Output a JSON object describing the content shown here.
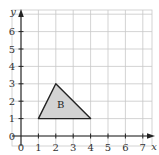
{
  "chart_data": {
    "type": "scatter",
    "title": "",
    "xlabel": "x",
    "ylabel": "y",
    "xlim": [
      0,
      7
    ],
    "ylim": [
      0,
      6
    ],
    "grid": true,
    "x_ticks": [
      "0",
      "1",
      "2",
      "3",
      "4",
      "5",
      "6",
      "7"
    ],
    "y_ticks": [
      "0",
      "1",
      "2",
      "3",
      "4",
      "5",
      "6"
    ],
    "shapes": [
      {
        "label": "B",
        "kind": "triangle",
        "vertices": [
          [
            1,
            1
          ],
          [
            2,
            3
          ],
          [
            4,
            1
          ]
        ],
        "fill": "#d3d3d3"
      }
    ]
  }
}
